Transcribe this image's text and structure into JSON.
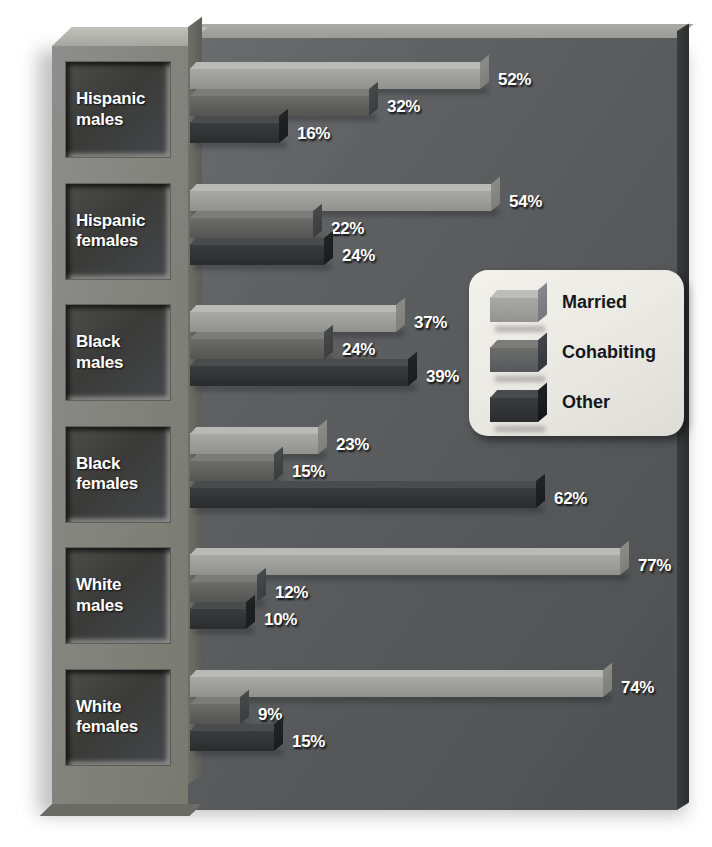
{
  "chart_data": {
    "type": "bar",
    "orientation": "horizontal",
    "title": "",
    "xlabel": "",
    "ylabel": "",
    "xlim": [
      0,
      80
    ],
    "grid": false,
    "legend_position": "middle-right",
    "value_suffix": "%",
    "categories": [
      "Hispanic males",
      "Hispanic females",
      "Black males",
      "Black females",
      "White males",
      "White females"
    ],
    "series": [
      {
        "name": "Married",
        "color": "#9c9d99",
        "values": [
          52,
          54,
          37,
          23,
          77,
          74
        ]
      },
      {
        "name": "Cohabiting",
        "color": "#5f605e",
        "values": [
          32,
          22,
          24,
          15,
          12,
          9
        ]
      },
      {
        "name": "Other",
        "color": "#323335",
        "values": [
          16,
          24,
          39,
          62,
          10,
          15
        ]
      }
    ],
    "labels": [
      [
        "52%",
        "32%",
        "16%"
      ],
      [
        "54%",
        "22%",
        "24%"
      ],
      [
        "37%",
        "24%",
        "39%"
      ],
      [
        "23%",
        "15%",
        "62%"
      ],
      [
        "77%",
        "12%",
        "10%"
      ],
      [
        "74%",
        "9%",
        "15%"
      ]
    ]
  },
  "legend": {
    "items": [
      {
        "label": "Married"
      },
      {
        "label": "Cohabiting"
      },
      {
        "label": "Other"
      }
    ]
  },
  "axis_labels": {
    "items": [
      {
        "line1": "Hispanic",
        "line2": "males"
      },
      {
        "line1": "Hispanic",
        "line2": "females"
      },
      {
        "line1": "Black",
        "line2": "males"
      },
      {
        "line1": "Black",
        "line2": "females"
      },
      {
        "line1": "White",
        "line2": "males"
      },
      {
        "line1": "White",
        "line2": "females"
      }
    ]
  }
}
